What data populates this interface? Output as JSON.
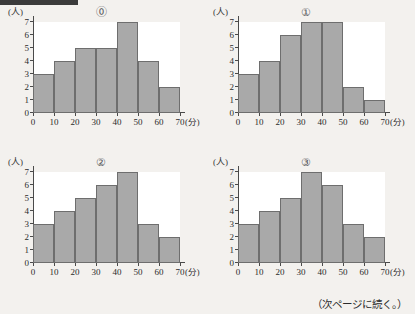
{
  "page": {
    "footnote": "（次ページに続く。）"
  },
  "axis": {
    "y_unit": "(人)",
    "x_unit": "(分)",
    "y_ticks": [
      "0",
      "1",
      "2",
      "3",
      "4",
      "5",
      "6",
      "7"
    ],
    "x_ticks": [
      "0",
      "10",
      "20",
      "30",
      "40",
      "50",
      "60",
      "70"
    ]
  },
  "style": {
    "bar_fill": "#a9a9a9",
    "bar_stroke": "#6e6e6e",
    "axis_color": "#4a4a4a",
    "page_background": "#f3f1ee",
    "plot_background": "#ffffff"
  },
  "chart_data": [
    {
      "type": "bar",
      "title": "⓪",
      "categories": [
        "0-10",
        "10-20",
        "20-30",
        "30-40",
        "40-50",
        "50-60",
        "60-70"
      ],
      "bin_edges": [
        0,
        10,
        20,
        30,
        40,
        50,
        60,
        70
      ],
      "values": [
        3,
        4,
        5,
        5,
        7,
        4,
        2
      ],
      "xlabel": "(分)",
      "ylabel": "(人)",
      "xlim": [
        0,
        70
      ],
      "ylim": [
        0,
        7
      ],
      "grid": false,
      "legend": false
    },
    {
      "type": "bar",
      "title": "①",
      "categories": [
        "0-10",
        "10-20",
        "20-30",
        "30-40",
        "40-50",
        "50-60",
        "60-70"
      ],
      "bin_edges": [
        0,
        10,
        20,
        30,
        40,
        50,
        60,
        70
      ],
      "values": [
        3,
        4,
        6,
        7,
        7,
        2,
        1
      ],
      "xlabel": "(分)",
      "ylabel": "(人)",
      "xlim": [
        0,
        70
      ],
      "ylim": [
        0,
        7
      ],
      "grid": false,
      "legend": false
    },
    {
      "type": "bar",
      "title": "②",
      "categories": [
        "0-10",
        "10-20",
        "20-30",
        "30-40",
        "40-50",
        "50-60",
        "60-70"
      ],
      "bin_edges": [
        0,
        10,
        20,
        30,
        40,
        50,
        60,
        70
      ],
      "values": [
        3,
        4,
        5,
        6,
        7,
        3,
        2
      ],
      "xlabel": "(分)",
      "ylabel": "(人)",
      "xlim": [
        0,
        70
      ],
      "ylim": [
        0,
        7
      ],
      "grid": false,
      "legend": false
    },
    {
      "type": "bar",
      "title": "③",
      "categories": [
        "0-10",
        "10-20",
        "20-30",
        "30-40",
        "40-50",
        "50-60",
        "60-70"
      ],
      "bin_edges": [
        0,
        10,
        20,
        30,
        40,
        50,
        60,
        70
      ],
      "values": [
        3,
        4,
        5,
        7,
        6,
        3,
        2
      ],
      "xlabel": "(分)",
      "ylabel": "(人)",
      "xlim": [
        0,
        70
      ],
      "ylim": [
        0,
        7
      ],
      "grid": false,
      "legend": false
    }
  ]
}
